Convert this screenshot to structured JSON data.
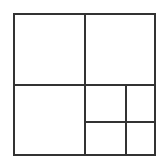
{
  "canvas": {
    "width": 168,
    "height": 167,
    "background_color": "#ffffff"
  },
  "figure": {
    "name": "nested-square-subdivision",
    "stroke_color": "#333333",
    "fill_color": "#ffffff",
    "outer_stroke_width": 2,
    "inner_stroke_width": 2
  },
  "geometry": {
    "outer_square": {
      "x": 14,
      "y": 14,
      "width": 141,
      "height": 141
    },
    "main_vertical_divider": {
      "x": 85,
      "y1": 14,
      "y2": 155
    },
    "main_horizontal_divider": {
      "y": 85,
      "x1": 14,
      "x2": 155
    },
    "sub_vertical_divider": {
      "x": 126,
      "y1": 85,
      "y2": 155
    },
    "sub_horizontal_divider": {
      "y": 122,
      "x1": 85,
      "x2": 155
    }
  },
  "cells": [
    {
      "id": "top-left",
      "x": 14,
      "y": 14,
      "width": 71,
      "height": 71
    },
    {
      "id": "top-right",
      "x": 85,
      "y": 14,
      "width": 70,
      "height": 71
    },
    {
      "id": "bottom-left",
      "x": 14,
      "y": 85,
      "width": 71,
      "height": 70
    },
    {
      "id": "bottom-right-upper-left",
      "x": 85,
      "y": 85,
      "width": 41,
      "height": 37
    },
    {
      "id": "bottom-right-upper-right",
      "x": 126,
      "y": 85,
      "width": 29,
      "height": 37
    },
    {
      "id": "bottom-right-lower-left",
      "x": 85,
      "y": 122,
      "width": 41,
      "height": 33
    },
    {
      "id": "bottom-right-lower-right",
      "x": 126,
      "y": 122,
      "width": 29,
      "height": 33
    }
  ],
  "labels": {
    "text_items": []
  }
}
